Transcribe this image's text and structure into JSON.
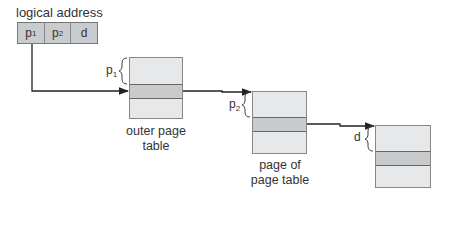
{
  "diagram": {
    "title": "logical address",
    "address_fields": [
      {
        "label": "p",
        "sub": "1"
      },
      {
        "label": "p",
        "sub": "2"
      },
      {
        "label": "d",
        "sub": ""
      }
    ],
    "tables": [
      {
        "name": "outer-page-table",
        "label_line1": "outer page",
        "label_line2": "table",
        "brace_label": "p",
        "brace_sub": "1"
      },
      {
        "name": "page-of-page-table",
        "label_line1": "page of",
        "label_line2": "page table",
        "brace_label": "p",
        "brace_sub": "2"
      },
      {
        "name": "memory-page",
        "label_line1": "",
        "label_line2": "",
        "brace_label": "d",
        "brace_sub": ""
      }
    ],
    "colors": {
      "table_fill": "#e6e8ea",
      "band_fill": "#c8cacc",
      "address_fill": "#c9cccf",
      "line": "#222222"
    }
  }
}
